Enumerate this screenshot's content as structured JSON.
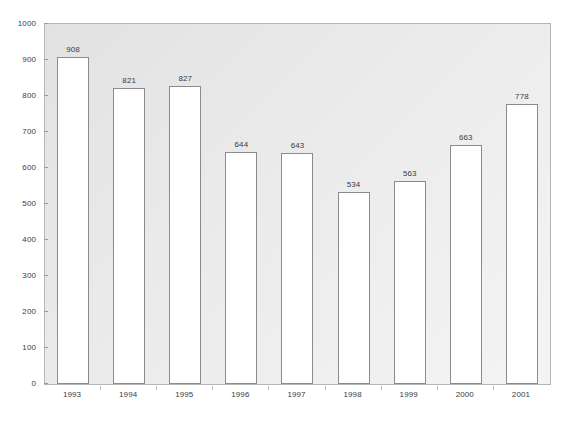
{
  "chart_data": {
    "type": "bar",
    "title": "",
    "xlabel": "",
    "ylabel": "",
    "categories": [
      "1993",
      "1994",
      "1995",
      "1996",
      "1997",
      "1998",
      "1999",
      "2000",
      "2001"
    ],
    "values": [
      908,
      821,
      827,
      644,
      643,
      534,
      563,
      663,
      778
    ],
    "ylim": [
      0,
      1000
    ],
    "ytick_values": [
      0,
      100,
      200,
      300,
      400,
      500,
      600,
      700,
      800,
      900,
      1000
    ],
    "ytick_labels": [
      "0",
      "100",
      "200",
      "300",
      "400",
      "500",
      "600",
      "700",
      "800",
      "900",
      "1000"
    ],
    "data_labels": [
      "908",
      "821",
      "827",
      "644",
      "643",
      "534",
      "563",
      "663",
      "778"
    ],
    "grid": false,
    "legend": null,
    "bar_fill_color": "#ffffff",
    "bar_edge_color": "#8b8b8b",
    "plot_background_top_left": "#e2e2e2",
    "plot_background_bottom_right": "#f4f4f5",
    "plot_border_color": "#b6b6b6",
    "text_color": "#3b3b3b"
  }
}
